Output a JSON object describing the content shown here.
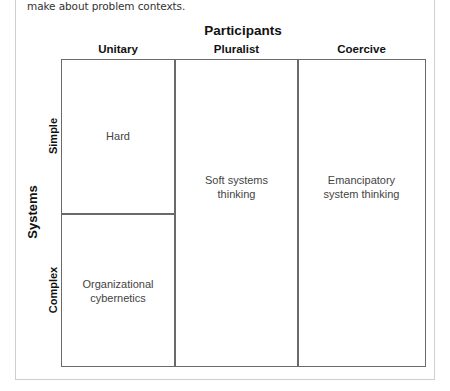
{
  "caption": "make about problem contexts.",
  "diagram": {
    "x_axis_title": "Participants",
    "y_axis_title": "Systems",
    "columns": [
      {
        "label": "Unitary"
      },
      {
        "label": "Pluralist"
      },
      {
        "label": "Coercive"
      }
    ],
    "rows": [
      {
        "label": "Simple"
      },
      {
        "label": "Complex"
      }
    ],
    "cells": {
      "unitary_simple": "Hard",
      "unitary_complex_line1": "Organizational",
      "unitary_complex_line2": "cybernetics",
      "pluralist_line1": "Soft systems",
      "pluralist_line2": "thinking",
      "coercive_line1": "Emancipatory",
      "coercive_line2": "system thinking"
    },
    "colors": {
      "grid_line": "#6a6a6a",
      "frame": "#cfcfcf",
      "cell_text": "#444444",
      "header_text": "#111111"
    }
  }
}
